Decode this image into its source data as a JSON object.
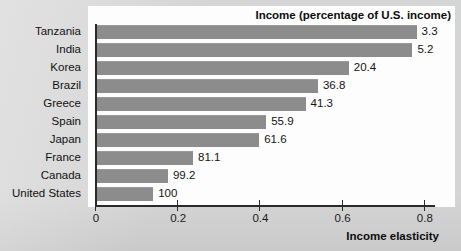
{
  "chart_data": {
    "type": "bar",
    "orientation": "horizontal",
    "title": "Income (percentage of U.S. income)",
    "xlabel": "Income elasticity",
    "ylabel": "",
    "xlim": [
      0,
      0.826
    ],
    "xticks": [
      0,
      0.2,
      0.4,
      0.6,
      0.8
    ],
    "xticklabels": [
      "0",
      "0.2",
      "0.4",
      "0.6",
      "0.8"
    ],
    "grid": false,
    "legend": null,
    "bar_color": "#8c8c8c",
    "categories": [
      "Tanzania",
      "India",
      "Korea",
      "Brazil",
      "Greece",
      "Spain",
      "Japan",
      "France",
      "Canada",
      "United States"
    ],
    "values": [
      0.78,
      0.77,
      0.615,
      0.54,
      0.51,
      0.414,
      0.397,
      0.236,
      0.175,
      0.139
    ],
    "data_labels": [
      "3.3",
      "5.2",
      "20.4",
      "36.8",
      "41.3",
      "55.9",
      "61.6",
      "81.1",
      "99.2",
      "100"
    ],
    "series": [
      {
        "name": "Income elasticity",
        "values": [
          0.78,
          0.77,
          0.615,
          0.54,
          0.51,
          0.414,
          0.397,
          0.236,
          0.175,
          0.139
        ]
      },
      {
        "name": "Income (percentage of U.S. income)",
        "values": [
          3.3,
          5.2,
          20.4,
          36.8,
          41.3,
          55.9,
          61.6,
          81.1,
          99.2,
          100
        ]
      }
    ],
    "rows": [
      {
        "category": "Tanzania",
        "elasticity": 0.78,
        "label": "3.3"
      },
      {
        "category": "India",
        "elasticity": 0.77,
        "label": "5.2"
      },
      {
        "category": "Korea",
        "elasticity": 0.615,
        "label": "20.4"
      },
      {
        "category": "Brazil",
        "elasticity": 0.54,
        "label": "36.8"
      },
      {
        "category": "Greece",
        "elasticity": 0.51,
        "label": "41.3"
      },
      {
        "category": "Spain",
        "elasticity": 0.414,
        "label": "55.9"
      },
      {
        "category": "Japan",
        "elasticity": 0.397,
        "label": "61.6"
      },
      {
        "category": "France",
        "elasticity": 0.236,
        "label": "81.1"
      },
      {
        "category": "Canada",
        "elasticity": 0.175,
        "label": "99.2"
      },
      {
        "category": "United States",
        "elasticity": 0.139,
        "label": "100"
      }
    ]
  }
}
